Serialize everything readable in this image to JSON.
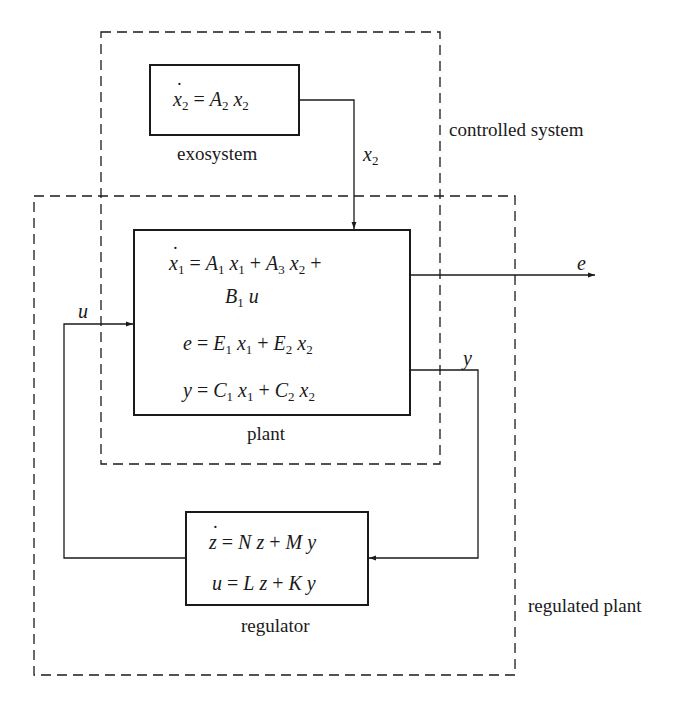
{
  "diagram": {
    "type": "block-diagram",
    "regions": {
      "controlled_system": {
        "label": "controlled system"
      },
      "regulated_plant": {
        "label": "regulated plant"
      }
    },
    "blocks": {
      "exosystem": {
        "caption": "exosystem",
        "equations": [
          "ẋ2 = A2 x2"
        ]
      },
      "plant": {
        "caption": "plant",
        "equations": [
          "ẋ1 = A1 x1 + A3 x2 +",
          "B1 u",
          "e = E1 x1 + E2 x2",
          "y = C1 x1 + C2 x2"
        ]
      },
      "regulator": {
        "caption": "regulator",
        "equations": [
          "ż = N z + M y",
          "u = L z + K y"
        ]
      }
    },
    "signals": {
      "x2": "x2",
      "e": "e",
      "y": "y",
      "u": "u"
    },
    "connections": [
      {
        "from": "exosystem",
        "to": "plant",
        "signal": "x2"
      },
      {
        "from": "plant",
        "to": "output",
        "signal": "e"
      },
      {
        "from": "plant",
        "to": "regulator",
        "signal": "y"
      },
      {
        "from": "regulator",
        "to": "plant",
        "signal": "u"
      }
    ]
  },
  "text": {
    "exo_eq": {
      "lhs": "x",
      "lhs_sub": "2",
      "eq": " = ",
      "a": "A",
      "a_sub": "2",
      "x": "x",
      "x_sub": "2"
    },
    "exo_caption": "exosystem",
    "plant_caption": "plant",
    "regulator_caption": "regulator",
    "controlled_label": "controlled system",
    "regulated_label": "regulated plant",
    "sig_x2": "x",
    "sig_x2_sub": "2",
    "sig_e": "e",
    "sig_y": "y",
    "sig_u": "u",
    "plant_eq1": {
      "lhs": "x",
      "lhs_sub": "1",
      "eq": " = ",
      "t1": "A",
      "t1_sub": "1",
      "t1x": "x",
      "t1x_sub": "1",
      "plus": " + ",
      "t2": "A",
      "t2_sub": "3",
      "t2x": "x",
      "t2x_sub": "2",
      "trail": " +"
    },
    "plant_eq1b": {
      "b": "B",
      "b_sub": "1",
      "u": "u"
    },
    "plant_eq2": {
      "lhs": "e",
      "eq": " = ",
      "t1": "E",
      "t1_sub": "1",
      "t1x": "x",
      "t1x_sub": "1",
      "plus": " + ",
      "t2": "E",
      "t2_sub": "2",
      "t2x": "x",
      "t2x_sub": "2"
    },
    "plant_eq3": {
      "lhs": "y",
      "eq": " = ",
      "t1": "C",
      "t1_sub": "1",
      "t1x": "x",
      "t1x_sub": "1",
      "plus": " + ",
      "t2": "C",
      "t2_sub": "2",
      "t2x": "x",
      "t2x_sub": "2"
    },
    "reg_eq1": {
      "lhs": "z",
      "eq": " = ",
      "t1": "N",
      "t1v": "z",
      "plus": " + ",
      "t2": "M",
      "t2v": "y"
    },
    "reg_eq2": {
      "lhs": "u",
      "eq": " = ",
      "t1": "L",
      "t1v": "z",
      "plus": " + ",
      "t2": "K",
      "t2v": "y"
    }
  }
}
